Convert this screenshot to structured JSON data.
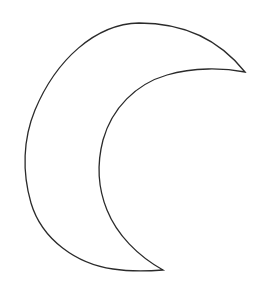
{
  "canvas": {
    "width": 261,
    "height": 288,
    "background_color": "#ffffff",
    "alt_text": "Crescent moon outline drawing"
  },
  "artwork": {
    "name": "crescent-moon",
    "type": "line-art-outline",
    "stroke_color": "#2b2b2b",
    "stroke_width": 1.3,
    "fill_color": "none",
    "orientation": "cusps-point-right",
    "upper_cusp": {
      "x": 245,
      "y": 72
    },
    "lower_cusp": {
      "x": 163,
      "y": 270
    },
    "outer_arc": {
      "name": "outer-limb",
      "apex_top": {
        "x": 140,
        "y": 23
      },
      "leftmost": {
        "x": 26,
        "y": 152
      },
      "apex_bottom": {
        "x": 104,
        "y": 262
      },
      "path": "M 245 72 C 214 33, 173 23, 139 23 C 95 24, 56 60, 35 110 C 23 139, 22 172, 31 203 C 42 240, 77 264, 113 269 C 132 272, 150 271, 163 270"
    },
    "inner_arc": {
      "name": "inner-limb",
      "leftmost": {
        "x": 100,
        "y": 170
      },
      "path": "M 163 270 C 138 256, 117 235, 107 210 C 98 188, 97 163, 103 140 C 112 108, 136 84, 167 75 C 194 67, 224 68, 245 72"
    },
    "combined_path": "M 245 72 C 214 33, 173 23, 139 23 C 95 24, 56 60, 35 110 C 23 139, 22 172, 31 203 C 42 240, 77 264, 113 269 C 132 272, 150 271, 163 270 C 138 256, 117 235, 107 210 C 98 188, 97 163, 103 140 C 112 108, 136 84, 167 75 C 194 67, 224 68, 245 72 Z"
  }
}
